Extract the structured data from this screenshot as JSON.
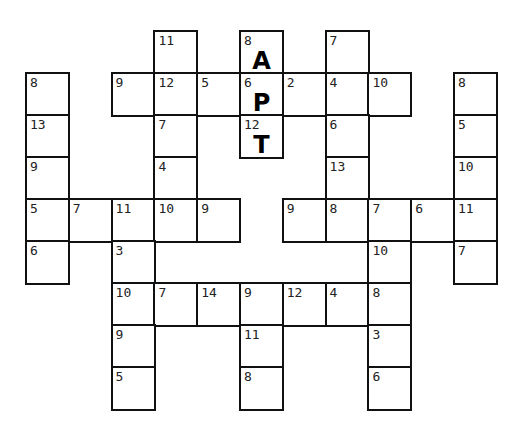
{
  "puzzle": {
    "type": "number-code crossword",
    "grid_origin": {
      "x": 26,
      "y": 31
    },
    "cell_size": {
      "w": 42.8,
      "h": 42
    },
    "cells": [
      {
        "row": 0,
        "col": 3,
        "number": "11",
        "letter": ""
      },
      {
        "row": 0,
        "col": 5,
        "number": "8",
        "letter": "A"
      },
      {
        "row": 0,
        "col": 7,
        "number": "7",
        "letter": ""
      },
      {
        "row": 1,
        "col": 0,
        "number": "8",
        "letter": ""
      },
      {
        "row": 1,
        "col": 2,
        "number": "9",
        "letter": ""
      },
      {
        "row": 1,
        "col": 3,
        "number": "12",
        "letter": ""
      },
      {
        "row": 1,
        "col": 4,
        "number": "5",
        "letter": ""
      },
      {
        "row": 1,
        "col": 5,
        "number": "6",
        "letter": "P"
      },
      {
        "row": 1,
        "col": 6,
        "number": "2",
        "letter": ""
      },
      {
        "row": 1,
        "col": 7,
        "number": "4",
        "letter": ""
      },
      {
        "row": 1,
        "col": 8,
        "number": "10",
        "letter": ""
      },
      {
        "row": 1,
        "col": 10,
        "number": "8",
        "letter": ""
      },
      {
        "row": 2,
        "col": 0,
        "number": "13",
        "letter": ""
      },
      {
        "row": 2,
        "col": 3,
        "number": "7",
        "letter": ""
      },
      {
        "row": 2,
        "col": 5,
        "number": "12",
        "letter": "T"
      },
      {
        "row": 2,
        "col": 7,
        "number": "6",
        "letter": ""
      },
      {
        "row": 2,
        "col": 10,
        "number": "5",
        "letter": ""
      },
      {
        "row": 3,
        "col": 0,
        "number": "9",
        "letter": ""
      },
      {
        "row": 3,
        "col": 3,
        "number": "4",
        "letter": ""
      },
      {
        "row": 3,
        "col": 7,
        "number": "13",
        "letter": ""
      },
      {
        "row": 3,
        "col": 10,
        "number": "10",
        "letter": ""
      },
      {
        "row": 4,
        "col": 0,
        "number": "5",
        "letter": ""
      },
      {
        "row": 4,
        "col": 1,
        "number": "7",
        "letter": ""
      },
      {
        "row": 4,
        "col": 2,
        "number": "11",
        "letter": ""
      },
      {
        "row": 4,
        "col": 3,
        "number": "10",
        "letter": ""
      },
      {
        "row": 4,
        "col": 4,
        "number": "9",
        "letter": ""
      },
      {
        "row": 4,
        "col": 6,
        "number": "9",
        "letter": ""
      },
      {
        "row": 4,
        "col": 7,
        "number": "8",
        "letter": ""
      },
      {
        "row": 4,
        "col": 8,
        "number": "7",
        "letter": ""
      },
      {
        "row": 4,
        "col": 9,
        "number": "6",
        "letter": ""
      },
      {
        "row": 4,
        "col": 10,
        "number": "11",
        "letter": ""
      },
      {
        "row": 5,
        "col": 0,
        "number": "6",
        "letter": ""
      },
      {
        "row": 5,
        "col": 2,
        "number": "3",
        "letter": ""
      },
      {
        "row": 5,
        "col": 8,
        "number": "10",
        "letter": ""
      },
      {
        "row": 5,
        "col": 10,
        "number": "7",
        "letter": ""
      },
      {
        "row": 6,
        "col": 2,
        "number": "10",
        "letter": ""
      },
      {
        "row": 6,
        "col": 3,
        "number": "7",
        "letter": ""
      },
      {
        "row": 6,
        "col": 4,
        "number": "14",
        "letter": ""
      },
      {
        "row": 6,
        "col": 5,
        "number": "9",
        "letter": ""
      },
      {
        "row": 6,
        "col": 6,
        "number": "12",
        "letter": ""
      },
      {
        "row": 6,
        "col": 7,
        "number": "4",
        "letter": ""
      },
      {
        "row": 6,
        "col": 8,
        "number": "8",
        "letter": ""
      },
      {
        "row": 7,
        "col": 2,
        "number": "9",
        "letter": ""
      },
      {
        "row": 7,
        "col": 5,
        "number": "11",
        "letter": ""
      },
      {
        "row": 7,
        "col": 8,
        "number": "3",
        "letter": ""
      },
      {
        "row": 8,
        "col": 2,
        "number": "5",
        "letter": ""
      },
      {
        "row": 8,
        "col": 5,
        "number": "8",
        "letter": ""
      },
      {
        "row": 8,
        "col": 8,
        "number": "6",
        "letter": ""
      }
    ]
  }
}
